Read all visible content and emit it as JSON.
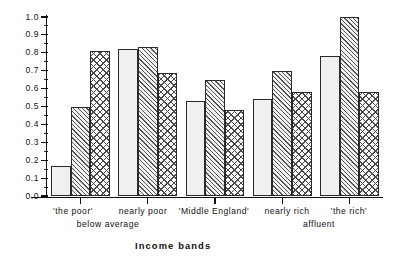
{
  "chart_data": {
    "type": "bar",
    "title": "",
    "xlabel": "Income bands",
    "ylabel": "",
    "ylim": [
      0.0,
      1.0
    ],
    "ytick_labels": [
      "0.0",
      "0.1",
      "0.2",
      "0.3",
      "0.4",
      "0.5",
      "0.6",
      "0.7",
      "0.8",
      "0.9",
      "1.0"
    ],
    "ytick_values": [
      0.0,
      0.1,
      0.2,
      0.3,
      0.4,
      0.5,
      0.6,
      0.7,
      0.8,
      0.9,
      1.0
    ],
    "grid": false,
    "legend": "none",
    "categories": [
      "'the poor'",
      "nearly poor",
      "'Middle England'",
      "nearly rich",
      "'the rich'"
    ],
    "category_sublabels": [
      "below average",
      "",
      "",
      "affluent",
      ""
    ],
    "group_size": 3,
    "series": [
      {
        "name": "series-1",
        "pattern": "dotted",
        "values": [
          0.17,
          0.82,
          0.53,
          0.54,
          0.78
        ]
      },
      {
        "name": "series-2",
        "pattern": "diagonal-hatch",
        "values": [
          0.5,
          0.83,
          0.65,
          0.7,
          1.0
        ]
      },
      {
        "name": "series-3",
        "pattern": "diamond-grid",
        "values": [
          0.81,
          0.69,
          0.48,
          0.58,
          0.58
        ]
      }
    ],
    "bars": [
      {
        "index": 1,
        "group": "'the poor'",
        "pattern": "dotted",
        "value": 0.17
      },
      {
        "index": 2,
        "group": "'the poor'",
        "pattern": "diagonal-hatch",
        "value": 0.5
      },
      {
        "index": 3,
        "group": "'the poor'",
        "pattern": "diamond-grid",
        "value": 0.81
      },
      {
        "index": 4,
        "group": "nearly poor",
        "pattern": "dotted",
        "value": 0.82
      },
      {
        "index": 5,
        "group": "nearly poor",
        "pattern": "diagonal-hatch",
        "value": 0.83
      },
      {
        "index": 6,
        "group": "nearly poor",
        "pattern": "diamond-grid",
        "value": 0.69
      },
      {
        "index": 7,
        "group": "'Middle England'",
        "pattern": "dotted",
        "value": 0.53
      },
      {
        "index": 8,
        "group": "'Middle England'",
        "pattern": "diagonal-hatch",
        "value": 0.65
      },
      {
        "index": 9,
        "group": "'Middle England'",
        "pattern": "diamond-grid",
        "value": 0.48
      },
      {
        "index": 10,
        "group": "nearly rich",
        "pattern": "dotted",
        "value": 0.54
      },
      {
        "index": 11,
        "group": "nearly rich",
        "pattern": "diagonal-hatch",
        "value": 0.7
      },
      {
        "index": 12,
        "group": "nearly rich",
        "pattern": "diamond-grid",
        "value": 0.58
      },
      {
        "index": 13,
        "group": "'the rich'",
        "pattern": "dotted",
        "value": 0.78
      },
      {
        "index": 14,
        "group": "'the rich'",
        "pattern": "diagonal-hatch",
        "value": 1.0
      },
      {
        "index": 15,
        "group": "'the rich'",
        "pattern": "diamond-grid",
        "value": 0.58
      }
    ]
  },
  "axis": {
    "x_title": "Income bands",
    "y_labels": [
      "1.0",
      "0.9",
      "0.8",
      "0.7",
      "0.6",
      "0.5",
      "0.4",
      "0.3",
      "0.2",
      "0.1",
      "0.0"
    ]
  },
  "labels": {
    "row1": [
      "'the poor'",
      "nearly poor",
      "'Middle England'",
      "nearly rich",
      "'the rich'"
    ],
    "row2": [
      "below average",
      "affluent"
    ]
  },
  "colors": {
    "axis": "#111111",
    "bar_outline": "#2a2a2a",
    "background": "#ffffff"
  }
}
